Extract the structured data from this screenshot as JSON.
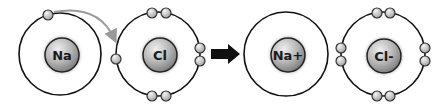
{
  "diagram": {
    "colors": {
      "shell": "#111111",
      "nucleus_light": "#e6e6e6",
      "nucleus_dark": "#8a8a8a",
      "electron_light": "#f0f0f0",
      "electron_dark": "#a8a8a8",
      "transfer_arrow": "#9a9a9a",
      "reaction_arrow": "#111111"
    },
    "atoms": [
      {
        "id": "na",
        "label": "Na",
        "cx": 60,
        "cy": 54,
        "r": 41,
        "nucleus_cx": 62,
        "nucleus_cy": 55,
        "nucleus_r": 17,
        "electrons": [
          [
            48,
            15
          ]
        ]
      },
      {
        "id": "cl",
        "label": "Cl",
        "cx": 158,
        "cy": 54,
        "r": 42,
        "nucleus_cx": 160,
        "nucleus_cy": 55,
        "nucleus_r": 17,
        "electrons": [
          [
            152,
            13
          ],
          [
            166,
            13
          ],
          [
            152,
            96
          ],
          [
            166,
            96
          ],
          [
            200,
            48
          ],
          [
            200,
            61
          ],
          [
            116,
            59
          ]
        ]
      },
      {
        "id": "na-ion",
        "label": "Na+",
        "cx": 286,
        "cy": 54,
        "r": 42,
        "nucleus_cx": 288,
        "nucleus_cy": 55,
        "nucleus_r": 17,
        "electrons": []
      },
      {
        "id": "cl-ion",
        "label": "Cl-",
        "cx": 383,
        "cy": 54,
        "r": 42,
        "nucleus_cx": 384,
        "nucleus_cy": 56,
        "nucleus_r": 17,
        "electrons": [
          [
            377,
            13
          ],
          [
            390,
            13
          ],
          [
            377,
            96
          ],
          [
            390,
            96
          ],
          [
            340,
            48
          ],
          [
            340,
            61
          ],
          [
            425,
            48
          ],
          [
            425,
            61
          ]
        ]
      }
    ],
    "transfer_arrow": {
      "from": [
        55,
        12
      ],
      "ctrl": [
        100,
        6
      ],
      "to": [
        115,
        40
      ],
      "label": "electron transfer"
    },
    "reaction_arrow": {
      "x1": 211,
      "x2": 240,
      "y": 54,
      "label": "reacts to form"
    }
  }
}
